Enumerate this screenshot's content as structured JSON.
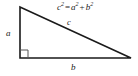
{
  "figure": {
    "name": "pythagorean-theorem-right-triangle",
    "background_color": "#ffffff",
    "stroke_color": "#1a1a1a",
    "label_color": "#1a1a1a",
    "right_angle_color": "#555555"
  },
  "equation": {
    "full_text": "c2 = a2 + b2",
    "lhs_base": "c",
    "lhs_exponent": "2",
    "equals": "=",
    "term1_base": "a",
    "term1_exponent": "2",
    "plus": "+",
    "term2_base": "b",
    "term2_exponent": "2"
  },
  "labels": {
    "vertical_leg": "a",
    "horizontal_leg": "b",
    "hypotenuse": "c"
  },
  "geometry": {
    "vertex_top": "20,7",
    "vertex_bottom_left": "20,58",
    "vertex_bottom_right": "131,58",
    "right_angle_marker_size": "8"
  }
}
